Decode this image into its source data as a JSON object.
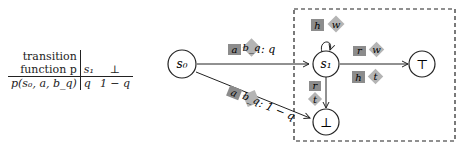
{
  "table": {
    "header_left_line1": "transition",
    "header_left_line2": "function p",
    "columns": [
      "s₁",
      "⊥"
    ],
    "row_label": "p(s₀, a, b_q)",
    "row_values": [
      "q",
      "1 − q"
    ]
  },
  "diagram": {
    "nodes": {
      "s0": "s₀",
      "s1": "s₁",
      "top": "⊤",
      "bottom": "⊥"
    },
    "edges": {
      "s0_s1": {
        "square": "a",
        "diamond": "b_q",
        "prob": ": q"
      },
      "s0_bottom": {
        "square": "a",
        "diamond": "b_q",
        "prob": ": 1 − q"
      },
      "s1_loop": {
        "square": "h",
        "diamond": "w"
      },
      "s1_top_upper": {
        "square": "r",
        "diamond": "w"
      },
      "s1_top_lower": {
        "square": "h",
        "diamond": "t"
      },
      "s1_bottom": {
        "square": "r",
        "diamond": "t"
      }
    },
    "colors": {
      "square_fill": "#8c8c8c",
      "diamond_fill": "#b4b4b4",
      "line": "#222222"
    }
  }
}
